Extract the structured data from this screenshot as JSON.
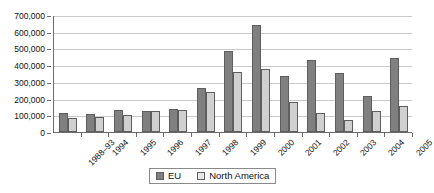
{
  "chart_data": {
    "type": "bar",
    "title": "",
    "xlabel": "",
    "ylabel": "",
    "ylim": [
      0,
      700000
    ],
    "ytick_labels": [
      "700,000",
      "600,000",
      "500,000",
      "400,000",
      "300,000",
      "200,000",
      "100,000",
      "0"
    ],
    "ytick_values": [
      700000,
      600000,
      500000,
      400000,
      300000,
      200000,
      100000,
      0
    ],
    "grid": true,
    "legend_position": "bottom-center",
    "categories": [
      "1988–93",
      "1994",
      "1995",
      "1996",
      "1997",
      "1998",
      "1999",
      "2000",
      "2001",
      "2002",
      "2003",
      "2004",
      "2005"
    ],
    "series": [
      {
        "name": "EU",
        "color": "#808080",
        "values": [
          115000,
          105000,
          130000,
          125000,
          135000,
          265000,
          485000,
          640000,
          335000,
          430000,
          353000,
          215000,
          443000
        ]
      },
      {
        "name": "North America",
        "color": "#d0d0d0",
        "values": [
          85000,
          88000,
          100000,
          125000,
          133000,
          240000,
          357000,
          377000,
          180000,
          113000,
          72000,
          126000,
          155000
        ]
      }
    ]
  },
  "legend": {
    "items": [
      {
        "label": "EU"
      },
      {
        "label": "North America"
      }
    ]
  }
}
